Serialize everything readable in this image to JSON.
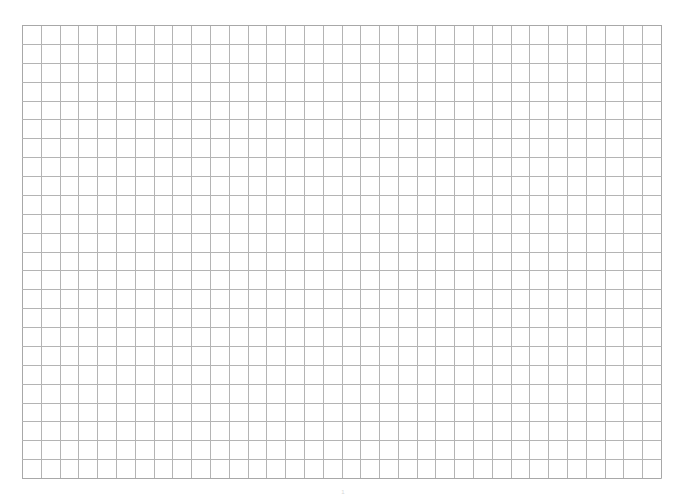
{
  "page": {
    "type": "grid-paper",
    "grid": {
      "columns": 34,
      "rows": 24,
      "line_color": "#b4b4b4",
      "border_color": "#a8a8a8"
    },
    "page_number": "1"
  }
}
